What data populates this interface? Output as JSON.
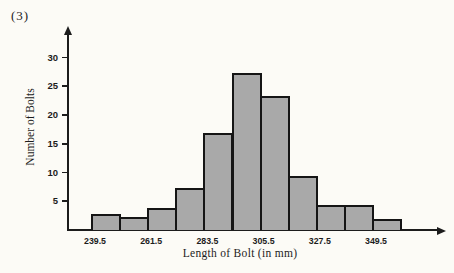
{
  "figure": {
    "label": "(3)"
  },
  "chart_data": {
    "type": "bar",
    "title": "",
    "xlabel": "Length of Bolt (in mm)",
    "ylabel": "Number of Bolts",
    "bin_width_mm": 11,
    "bin_edges": [
      239.5,
      250.5,
      261.5,
      272.5,
      283.5,
      294.5,
      305.5,
      316.5,
      327.5,
      338.5,
      349.5,
      360.5
    ],
    "values": [
      2.5,
      2,
      3.5,
      7,
      16.5,
      27,
      23,
      9,
      4,
      4,
      1.5
    ],
    "x_tick_labels": [
      "239.5",
      "261.5",
      "283.5",
      "305.5",
      "327.5",
      "349.5"
    ],
    "y_ticks": [
      5,
      10,
      15,
      20,
      25,
      30
    ],
    "ylim": [
      0,
      33
    ],
    "grid": false,
    "legend": "none",
    "bar_fill_color": "#a9a9a9",
    "bar_border_color": "#151515",
    "axis_color": "#1c1c1c"
  }
}
